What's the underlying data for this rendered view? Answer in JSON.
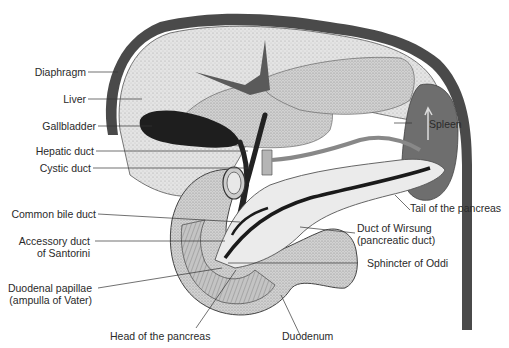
{
  "labels": {
    "diaphragm": "Diaphragm",
    "liver": "Liver",
    "gallbladder": "Gallbladder",
    "hepatic_duct": "Hepatic duct",
    "cystic_duct": "Cystic duct",
    "common_bile_duct": "Common bile duct",
    "accessory_duct_1": "Accessory duct",
    "accessory_duct_2": "of Santorini",
    "duodenal_papillae_1": "Duodenal papillae",
    "duodenal_papillae_2": "(ampulla of Vater)",
    "head_of_pancreas": "Head of the pancreas",
    "duodenum": "Duodenum",
    "spleen": "Spleen",
    "tail_of_pancreas": "Tail of the pancreas",
    "duct_of_wirsung_1": "Duct of Wirsung",
    "duct_of_wirsung_2": "(pancreatic duct)",
    "sphincter_of_oddi": "Sphincter of Oddi"
  },
  "colors": {
    "diaphragm": "#4a4a4a",
    "liver": "#e6e6e6",
    "liver_lobe": "#d4d4d4",
    "gallbladder": "#1e1e1e",
    "duct": "#222222",
    "spleen": "#6e6e6e",
    "pancreas": "#ebebeb",
    "duodenum": "#c8c8c8",
    "leader_line": "#333333"
  }
}
